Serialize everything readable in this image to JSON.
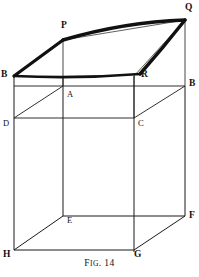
{
  "figure": {
    "caption_lead": "F",
    "caption_rest": "IG",
    "caption_tail": ". 14",
    "caption_full": "Fig. 14",
    "stroke_color": "#1a1a1a",
    "bold_stroke_color": "#111111",
    "background_color": "#ffffff",
    "vertices": {
      "top_left_bold": {
        "label": "B",
        "x": 4,
        "y": 70
      },
      "top_peak": {
        "label": "P",
        "x": 61,
        "y": 22
      },
      "top_right_bold": {
        "label": "Q",
        "x": 186,
        "y": 4
      },
      "top_mid_right": {
        "label": "R",
        "x": 146,
        "y": 72
      },
      "front_top_left": {
        "label": "B",
        "x": 4,
        "y": 70
      },
      "front_top_right": {
        "label": "B",
        "x": 188,
        "y": 82
      },
      "back_top_left": {
        "label": "A",
        "x": 66,
        "y": 89
      },
      "back_top_right": {
        "label": "C",
        "x": 139,
        "y": 118
      },
      "back_left_mid": {
        "label": "D",
        "x": 5,
        "y": 119
      },
      "inner_bottom_left": {
        "label": "E",
        "x": 66,
        "y": 213
      },
      "inner_bottom_right": {
        "label": "F",
        "x": 181,
        "y": 210
      },
      "front_bottom_right": {
        "label": "G",
        "x": 134,
        "y": 246
      },
      "front_bottom_left": {
        "label": "H",
        "x": 6,
        "y": 246
      }
    }
  },
  "labels": {
    "B_left": "B",
    "P": "P",
    "Q": "Q",
    "R": "R",
    "B_right": "B",
    "A": "A",
    "D": "D",
    "C": "C",
    "E": "E",
    "F": "F",
    "G": "G",
    "H": "H"
  }
}
